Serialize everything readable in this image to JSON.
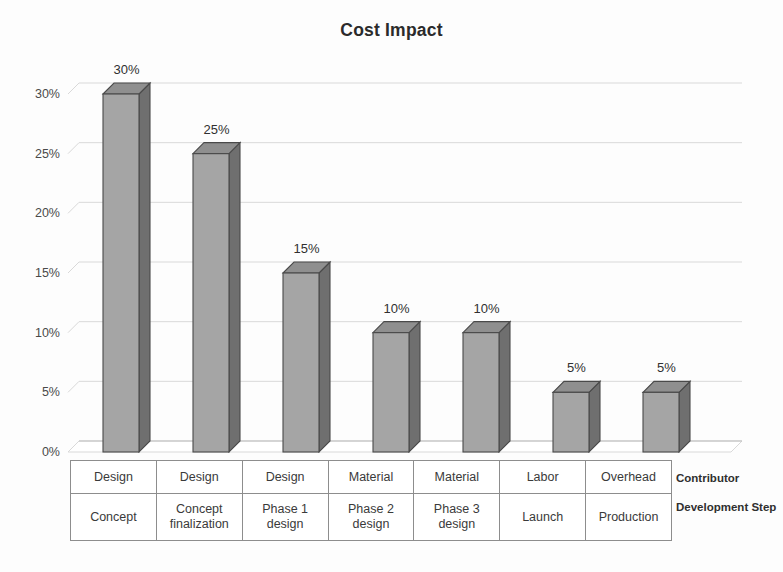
{
  "chart_data": {
    "type": "bar",
    "title": "Cost Impact",
    "xlabel": "",
    "ylabel": "",
    "ylim": [
      0,
      30
    ],
    "grid": true,
    "legend": "none",
    "categories": [
      "Concept",
      "Concept finalization",
      "Phase 1 design",
      "Phase 2 design",
      "Phase 3 design",
      "Launch",
      "Production"
    ],
    "values": [
      30,
      25,
      15,
      10,
      10,
      5,
      5
    ],
    "data_labels": [
      "30%",
      "25%",
      "15%",
      "10%",
      "10%",
      "5%",
      "5%"
    ],
    "y_ticks": [
      "0%",
      "5%",
      "10%",
      "15%",
      "20%",
      "25%",
      "30%"
    ],
    "y_tick_values": [
      0,
      5,
      10,
      15,
      20,
      25,
      30
    ],
    "series": [
      {
        "name": "Cost Impact",
        "values": [
          30,
          25,
          15,
          10,
          10,
          5,
          5
        ]
      }
    ],
    "table_rows": [
      {
        "legend": "Contributor",
        "cells": [
          "Design",
          "Design",
          "Design",
          "Material",
          "Material",
          "Labor",
          "Overhead"
        ]
      },
      {
        "legend": "Development Step",
        "cells": [
          "Concept",
          "Concept finalization",
          "Phase 1 design",
          "Phase 2 design",
          "Phase 3 design",
          "Launch",
          "Production"
        ]
      }
    ],
    "colors": {
      "bar_front": "#a5a5a5",
      "bar_side": "#6f6f6f",
      "bar_top": "#8f8f8f",
      "bar_outline": "#4a4a4a",
      "gridline": "#d9d9d9",
      "text": "#3a3a3a",
      "background": "#ffffff"
    }
  },
  "axis": {
    "y_labels": [
      "30%",
      "25%",
      "20%",
      "15%",
      "10%",
      "5%",
      "0%"
    ]
  },
  "table": {
    "row1_cells": [
      "Design",
      "Design",
      "Design",
      "Material",
      "Material",
      "Labor",
      "Overhead"
    ],
    "row2_cells": [
      "Concept",
      "Concept finalization",
      "Phase 1 design",
      "Phase 2 design",
      "Phase 3 design",
      "Launch",
      "Production"
    ],
    "row1_legend": "Contributor",
    "row2_legend": "Development Step"
  }
}
